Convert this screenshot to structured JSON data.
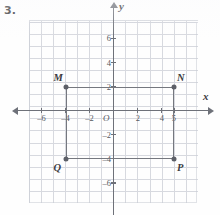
{
  "exercise": {
    "number": "3."
  },
  "graph": {
    "origin_label": "O",
    "x_axis_label": "x",
    "y_axis_label": "y",
    "x_tick_labels": [
      "-6",
      "-4",
      "-2",
      "2",
      "4",
      "5"
    ],
    "y_tick_labels": [
      "6",
      "4",
      "2",
      "-2",
      "-4",
      "-6"
    ]
  },
  "chart_data": {
    "type": "scatter",
    "title": "",
    "xlabel": "x",
    "ylabel": "y",
    "xlim": [
      -7,
      7
    ],
    "ylim": [
      -7.5,
      7.5
    ],
    "grid": true,
    "legend": "none",
    "x_ticks": [
      -6,
      -4,
      -2,
      2,
      4,
      5
    ],
    "x_tick_labels": [
      "-6",
      "-4",
      "-2",
      "2",
      "4",
      "5"
    ],
    "y_ticks": [
      6,
      4,
      2,
      -2,
      -4,
      -6
    ],
    "y_tick_labels": [
      "6",
      "4",
      "2",
      "-2",
      "-4",
      "-6"
    ],
    "origin_label": "O",
    "shapes": [
      {
        "name": "MNPQ",
        "type": "rectangle",
        "closed": true,
        "vertices": [
          {
            "label": "M",
            "x": -4,
            "y": 2,
            "label_position": "above-left"
          },
          {
            "label": "N",
            "x": 5,
            "y": 2,
            "label_position": "above-right"
          },
          {
            "label": "P",
            "x": 5,
            "y": -4,
            "label_position": "below-right"
          },
          {
            "label": "Q",
            "x": -4,
            "y": -4,
            "label_position": "below-left"
          }
        ],
        "width": 9,
        "height": 6
      }
    ],
    "points": [
      {
        "label": "M",
        "x": -4,
        "y": 2
      },
      {
        "label": "N",
        "x": 5,
        "y": 2
      },
      {
        "label": "P",
        "x": 5,
        "y": -4
      },
      {
        "label": "Q",
        "x": -4,
        "y": -4
      }
    ]
  },
  "colors": {
    "grid": "#c9ccd4",
    "axis": "#6e7179",
    "shape": "#75787f",
    "text": "#3c3c41"
  }
}
